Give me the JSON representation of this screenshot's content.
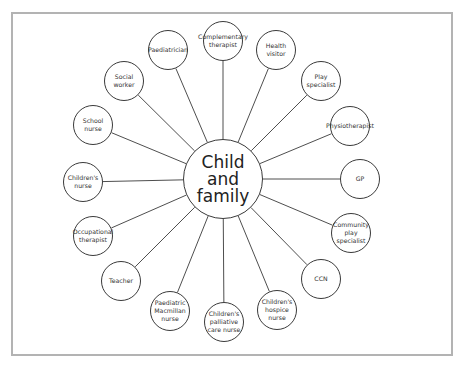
{
  "diagram": {
    "center": {
      "label": "Child\nand\nfamily",
      "x": 223,
      "y": 179,
      "r": 40
    },
    "node_radius": 20,
    "line_color": "#3a3a3a",
    "border_color": "#b3b3b3",
    "nodes": [
      {
        "label": "Complementary\ntherapist",
        "x": 223,
        "y": 41
      },
      {
        "label": "Health\nvisitor",
        "x": 276,
        "y": 50
      },
      {
        "label": "Play\nspecialist",
        "x": 321,
        "y": 81
      },
      {
        "label": "Physiotherapist",
        "x": 350,
        "y": 126
      },
      {
        "label": "GP",
        "x": 360,
        "y": 179
      },
      {
        "label": "Community\nplay\nspecialist",
        "x": 351,
        "y": 233
      },
      {
        "label": "CCN",
        "x": 321,
        "y": 279
      },
      {
        "label": "Children's\nhospice nurse",
        "x": 277,
        "y": 310
      },
      {
        "label": "Children's\npalliative\ncare nurse",
        "x": 224,
        "y": 322
      },
      {
        "label": "Paediatric\nMacmillan\nnurse",
        "x": 170,
        "y": 311
      },
      {
        "label": "Teacher",
        "x": 121,
        "y": 281
      },
      {
        "label": "Occupational\ntherapist",
        "x": 93,
        "y": 236
      },
      {
        "label": "Children's\nnurse",
        "x": 83,
        "y": 182
      },
      {
        "label": "School\nnurse",
        "x": 93,
        "y": 125
      },
      {
        "label": "Social\nworker",
        "x": 124,
        "y": 81
      },
      {
        "label": "Paediatrician",
        "x": 168,
        "y": 50
      }
    ]
  }
}
